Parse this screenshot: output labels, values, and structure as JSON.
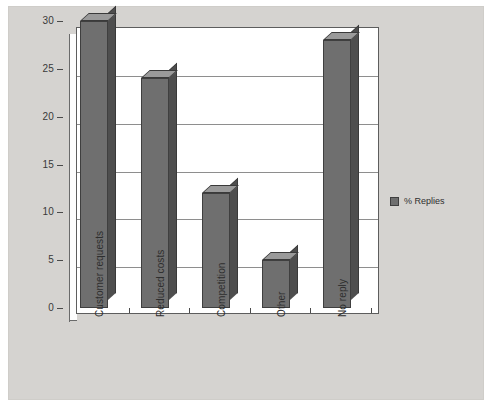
{
  "chart_data": {
    "type": "bar",
    "title": "",
    "subtitle": "",
    "xlabel": "",
    "ylabel": "",
    "categories": [
      "Customer requests",
      "Reduced costs",
      "Competition",
      "Other",
      "No reply"
    ],
    "series": [
      {
        "name": "% Replies",
        "values": [
          30,
          24,
          12,
          5,
          28
        ],
        "color": "#6f6f6f"
      }
    ],
    "ylim": [
      0,
      30
    ],
    "yticks": [
      0,
      5,
      10,
      15,
      20,
      25,
      30
    ],
    "ytick_labels": [
      "0",
      "5",
      "10",
      "15",
      "20",
      "25",
      "30"
    ],
    "grid": true,
    "grid_axis": "y",
    "legend": {
      "position": "right",
      "entries": [
        {
          "label": "% Replies",
          "color": "#6f6f6f"
        }
      ]
    },
    "style": {
      "canvas_color": "#d5d3d0",
      "plot_background": "#ffffff",
      "bar_front_color": "#6f6f6f",
      "bar_side_color": "#4e4e4e",
      "bar_top_color": "#9a9a9a",
      "axis_color": "#4a4a4a",
      "gridline_color": "#8e8e8e",
      "three_d": true,
      "xlabel_rotation": -90
    }
  }
}
